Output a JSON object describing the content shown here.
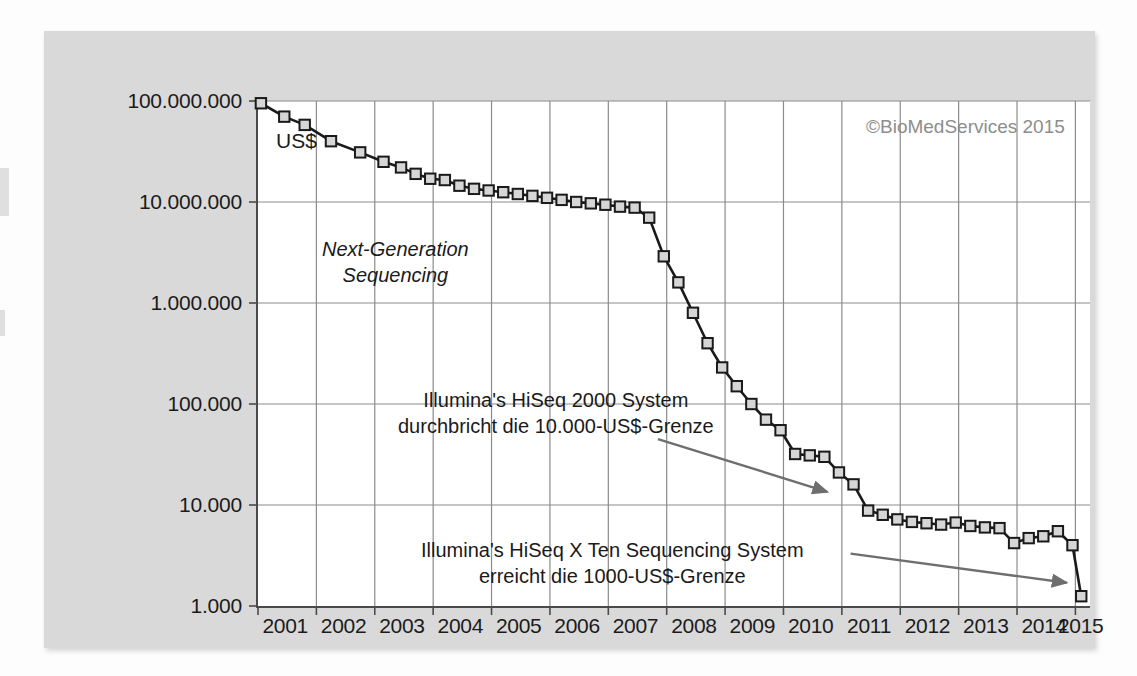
{
  "figure": {
    "unit_label": "US$",
    "copyright": "©BioMedServices 2015",
    "nextgen_label_line1": "Next-Generation",
    "nextgen_label_line2": "Sequencing",
    "annotation_1_line1": "Illumina's HiSeq 2000 System",
    "annotation_1_line2": "durchbricht die 10.000-US$-Grenze",
    "annotation_2_line1": "Illumina's HiSeq X Ten Sequencing System",
    "annotation_2_line2": "erreicht die 1000-US$-Grenze",
    "colors": {
      "panel_background": "#d9d9d9",
      "plot_background": "#ffffff",
      "axis": "#4a4a4a",
      "grid": "#8c8c8c",
      "line": "#1a1a1a",
      "marker_fill": "#d6d6d6",
      "marker_stroke": "#1a1a1a",
      "arrow": "#6e6e6e",
      "copyright_text": "#8d8d8d"
    }
  },
  "chart_data": {
    "type": "line",
    "title": "",
    "subtitle": "",
    "xlabel": "",
    "ylabel": "US$",
    "y_scale": "log",
    "ylim": [
      1000,
      100000000
    ],
    "xlim": [
      2001.0,
      2015.25
    ],
    "grid": true,
    "legend": "none",
    "ytick_labels": [
      "100.000.000",
      "10.000.000",
      "1.000.000",
      "100.000",
      "10.000",
      "1.000"
    ],
    "ytick_values": [
      100000000,
      10000000,
      1000000,
      100000,
      10000,
      1000
    ],
    "xtick_labels": [
      "2001",
      "2002",
      "2003",
      "2004",
      "2005",
      "2006",
      "2007",
      "2008",
      "2009",
      "2010",
      "2011",
      "2012",
      "2013",
      "2014",
      "2015"
    ],
    "xtick_values": [
      2001,
      2002,
      2003,
      2004,
      2005,
      2006,
      2007,
      2008,
      2009,
      2010,
      2011,
      2012,
      2013,
      2014,
      2015
    ],
    "series": [
      {
        "name": "Cost per genome",
        "x": [
          2001.05,
          2001.45,
          2001.8,
          2002.25,
          2002.75,
          2003.15,
          2003.45,
          2003.7,
          2003.95,
          2004.2,
          2004.45,
          2004.7,
          2004.95,
          2005.2,
          2005.45,
          2005.7,
          2005.95,
          2006.2,
          2006.45,
          2006.7,
          2006.95,
          2007.2,
          2007.45,
          2007.7,
          2007.95,
          2008.2,
          2008.45,
          2008.7,
          2008.95,
          2009.2,
          2009.45,
          2009.7,
          2009.95,
          2010.2,
          2010.45,
          2010.7,
          2010.95,
          2011.2,
          2011.45,
          2011.7,
          2011.95,
          2012.2,
          2012.45,
          2012.7,
          2012.95,
          2013.2,
          2013.45,
          2013.7,
          2013.95,
          2014.2,
          2014.45,
          2014.7,
          2014.95,
          2015.1
        ],
        "y": [
          95000000,
          70000000,
          58000000,
          40000000,
          31000000,
          25000000,
          22000000,
          19000000,
          17000000,
          16500000,
          14500000,
          13500000,
          13000000,
          12500000,
          12000000,
          11500000,
          11000000,
          10500000,
          10000000,
          9700000,
          9400000,
          9000000,
          8800000,
          7000000,
          2900000,
          1600000,
          800000,
          400000,
          230000,
          150000,
          100000,
          70000,
          55000,
          32000,
          31000,
          30000,
          21000,
          16000,
          8800,
          8000,
          7200,
          6800,
          6600,
          6400,
          6700,
          6200,
          6000,
          5900,
          4200,
          4700,
          4900,
          5500,
          4000,
          1250
        ]
      }
    ],
    "annotations": [
      {
        "text_line1": "Illumina's HiSeq 2000 System",
        "text_line2": "durchbricht die 10.000-US$-Grenze",
        "arrow_from": [
          2007.85,
          45000
        ],
        "arrow_to": [
          2010.75,
          13500
        ]
      },
      {
        "text_line1": "Illumina's HiSeq X Ten Sequencing System",
        "text_line2": "erreicht die 1000-US$-Grenze",
        "arrow_from": [
          2011.15,
          3300
        ],
        "arrow_to": [
          2014.85,
          1700
        ]
      },
      {
        "text_line1": "Next-Generation",
        "text_line2": "Sequencing",
        "position": [
          2002.95,
          1700000
        ]
      }
    ]
  }
}
